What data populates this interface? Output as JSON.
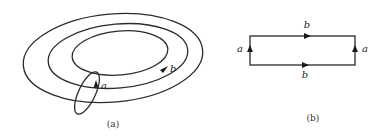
{
  "figure": {
    "panel_a": {
      "caption": "(a)",
      "description": "Torus drawn as concentric ellipses with meridian loop a and longitude loop b",
      "labels": {
        "meridian": "a",
        "longitude": "b"
      }
    },
    "panel_b": {
      "caption": "(b)",
      "description": "Rectangle with identified edges",
      "labels": {
        "top": "b",
        "bottom": "b",
        "left": "a",
        "right": "a"
      }
    },
    "colors": {
      "stroke": "#2a2a2a",
      "background": "#ffffff"
    }
  }
}
